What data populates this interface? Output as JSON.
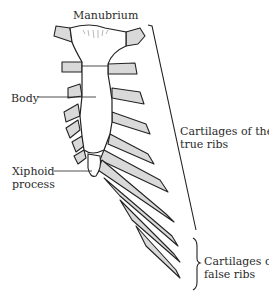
{
  "figure": {
    "colors": {
      "line": "#222222",
      "bone_fill": "#ffffff",
      "cartilage_fill": "#d9d9d9",
      "background": "#ffffff"
    }
  },
  "labels": {
    "manubrium": "Manubrium",
    "body": "Body",
    "xiphoid_line1": "Xiphoid",
    "xiphoid_line2": "process",
    "true_ribs_line1": "Cartilages of the",
    "true_ribs_line2": "true ribs",
    "false_ribs_line1": "Cartilages of",
    "false_ribs_line2": "false ribs"
  }
}
